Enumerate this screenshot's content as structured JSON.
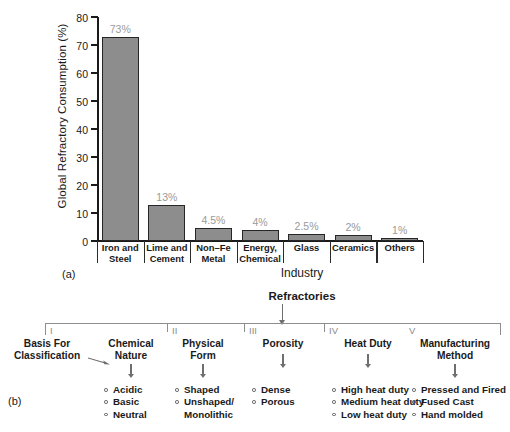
{
  "figure": {
    "panel_a_tag": "(a)",
    "panel_b_tag": "(b)"
  },
  "chart_data": {
    "type": "bar",
    "title": "",
    "xlabel": "Industry",
    "ylabel": "Global Refractory Consumption (%)",
    "ylim": [
      0,
      80
    ],
    "yticks": [
      0,
      10,
      20,
      30,
      40,
      50,
      60,
      70,
      80
    ],
    "grid": false,
    "legend": "none",
    "bar_color": "#8d8d8d",
    "bar_border_color": "#262626",
    "data_label_color": "#9a9a9a",
    "categories": [
      "Iron and Steel",
      "Lime and Cement",
      "Non–Fe Metal",
      "Energy, Chemical",
      "Glass",
      "Ceramics",
      "Others"
    ],
    "category_lines": [
      [
        "Iron and",
        "Steel"
      ],
      [
        "Lime and",
        "Cement"
      ],
      [
        "Non–Fe",
        "Metal"
      ],
      [
        "Energy,",
        "Chemical"
      ],
      [
        "Glass",
        ""
      ],
      [
        "Ceramics",
        ""
      ],
      [
        "Others",
        ""
      ]
    ],
    "values": [
      73,
      13,
      4.5,
      4,
      2.5,
      2,
      1
    ],
    "data_labels": [
      "73%",
      "13%",
      "4.5%",
      "4%",
      "2.5%",
      "2%",
      "1%"
    ]
  },
  "diagram": {
    "root": "Refractories",
    "basis_label_lines": [
      "Basis For",
      "Classification"
    ],
    "numerals": [
      "I",
      "II",
      "III",
      "IV",
      "V"
    ],
    "columns": [
      {
        "numeral": "I",
        "title_lines": [
          "Chemical",
          "Nature"
        ],
        "items": [
          "Acidic",
          "Basic",
          "Neutral"
        ]
      },
      {
        "numeral": "II",
        "title_lines": [
          "Physical",
          "Form"
        ],
        "items": [
          "Shaped",
          "Unshaped/",
          "Monolithic"
        ]
      },
      {
        "numeral": "III",
        "title_lines": [
          "Porosity",
          ""
        ],
        "items": [
          "Dense",
          "Porous"
        ]
      },
      {
        "numeral": "IV",
        "title_lines": [
          "Heat Duty",
          ""
        ],
        "items": [
          "High heat duty",
          "Medium heat duty",
          "Low heat duty"
        ]
      },
      {
        "numeral": "V",
        "title_lines": [
          "Manufacturing",
          "Method"
        ],
        "items": [
          "Pressed and Fired",
          "Fused Cast",
          "Hand molded"
        ]
      }
    ]
  }
}
